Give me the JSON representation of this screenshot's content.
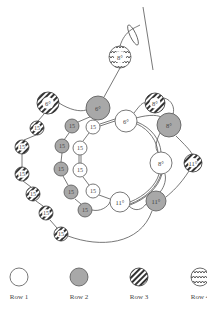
{
  "diagram": {
    "colors": {
      "line": "#555555",
      "row1_fill": "#ffffff",
      "row2_fill": "#a8a8a8",
      "row3_fill": "#ffffff",
      "row4_fill": "#ffffff",
      "stroke": "#555555"
    },
    "beads": [
      {
        "row": 4,
        "label": "8°",
        "cx": 120,
        "cy": 57,
        "r": 11
      },
      {
        "row": 3,
        "label": "6°",
        "cx": 48,
        "cy": 103,
        "r": 11
      },
      {
        "row": 2,
        "label": "6°",
        "cx": 98,
        "cy": 108,
        "r": 12
      },
      {
        "row": 1,
        "label": "6°",
        "cx": 126,
        "cy": 121,
        "r": 11
      },
      {
        "row": 3,
        "label": "8°",
        "cx": 155,
        "cy": 103,
        "r": 10
      },
      {
        "row": 2,
        "label": "8°",
        "cx": 169,
        "cy": 125,
        "r": 12
      },
      {
        "row": 1,
        "label": "8°",
        "cx": 161,
        "cy": 163,
        "r": 11
      },
      {
        "row": 3,
        "label": "11°",
        "cx": 193,
        "cy": 163,
        "r": 9
      },
      {
        "row": 2,
        "label": "11°",
        "cx": 156,
        "cy": 201,
        "r": 10
      },
      {
        "row": 1,
        "label": "11°",
        "cx": 120,
        "cy": 202,
        "r": 10
      },
      {
        "row": 1,
        "label": "15",
        "cx": 93,
        "cy": 127,
        "r": 7
      },
      {
        "row": 1,
        "label": "15",
        "cx": 80,
        "cy": 148,
        "r": 7
      },
      {
        "row": 1,
        "label": "15",
        "cx": 80,
        "cy": 170,
        "r": 7
      },
      {
        "row": 1,
        "label": "15",
        "cx": 93,
        "cy": 191,
        "r": 7
      },
      {
        "row": 2,
        "label": "15",
        "cx": 72,
        "cy": 126,
        "r": 7
      },
      {
        "row": 2,
        "label": "15",
        "cx": 62,
        "cy": 146,
        "r": 7
      },
      {
        "row": 2,
        "label": "15",
        "cx": 61,
        "cy": 169,
        "r": 7
      },
      {
        "row": 2,
        "label": "15",
        "cx": 71,
        "cy": 192,
        "r": 7
      },
      {
        "row": 2,
        "label": "15",
        "cx": 85,
        "cy": 210,
        "r": 7
      },
      {
        "row": 3,
        "label": "15",
        "cx": 37,
        "cy": 128,
        "r": 7
      },
      {
        "row": 3,
        "label": "15",
        "cx": 22,
        "cy": 147,
        "r": 7
      },
      {
        "row": 3,
        "label": "15",
        "cx": 22,
        "cy": 174,
        "r": 7
      },
      {
        "row": 3,
        "label": "15",
        "cx": 33,
        "cy": 194,
        "r": 7
      },
      {
        "row": 3,
        "label": "15",
        "cx": 46,
        "cy": 213,
        "r": 7
      },
      {
        "row": 3,
        "label": "15",
        "cx": 61,
        "cy": 234,
        "r": 7
      }
    ]
  },
  "legend": {
    "items": [
      {
        "label": "Row 1",
        "pattern": "plain"
      },
      {
        "label": "Row 2",
        "pattern": "gray"
      },
      {
        "label": "Row 3",
        "pattern": "diagonal-stripes"
      },
      {
        "label": "Row 4",
        "pattern": "zigzag"
      }
    ]
  }
}
